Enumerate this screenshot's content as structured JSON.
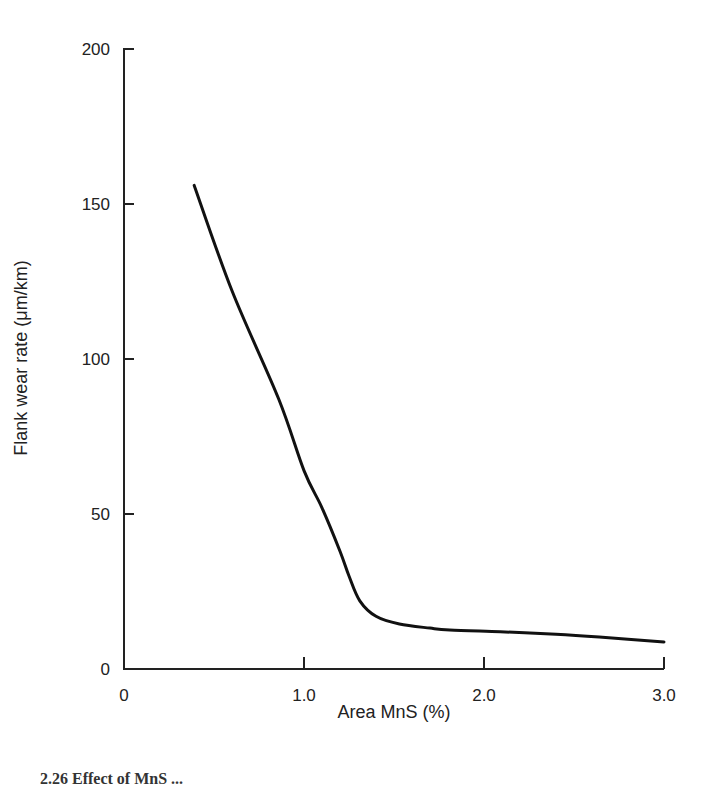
{
  "chart_data": {
    "type": "line",
    "title": "",
    "xlabel": "Area MnS (%)",
    "ylabel": "Flank wear rate (μm/km)",
    "xlim": [
      0,
      3.0
    ],
    "ylim": [
      0,
      200
    ],
    "x_ticks": [
      0,
      1.0,
      2.0,
      3.0
    ],
    "x_tick_labels": [
      "0",
      "1.0",
      "2.0",
      "3.0"
    ],
    "y_ticks": [
      0,
      50,
      100,
      150,
      200
    ],
    "y_tick_labels": [
      "0",
      "50",
      "100",
      "150",
      "200"
    ],
    "grid": false,
    "legend": null,
    "series": [
      {
        "name": "Flank wear rate",
        "x": [
          0.39,
          0.6,
          0.86,
          1.0,
          1.1,
          1.2,
          1.25,
          1.31,
          1.4,
          1.53,
          1.7,
          1.81,
          2.09,
          2.4,
          2.64,
          3.0
        ],
        "y": [
          156,
          122,
          87,
          64,
          52,
          38,
          30,
          22,
          17,
          14.5,
          13.2,
          12.6,
          12,
          11.2,
          10.3,
          8.7
        ]
      }
    ]
  },
  "caption": "2.26   Effect of MnS ..."
}
